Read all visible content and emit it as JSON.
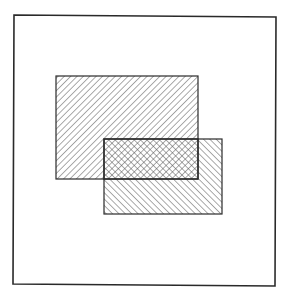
{
  "diagram": {
    "type": "venn-intersection",
    "background": "#ffffff",
    "stroke_color": "#2a2a2a",
    "hatch_color": "#555555",
    "universe": {
      "name": "universal-set",
      "corners": [
        [
          14,
          15
        ],
        [
          276,
          17
        ],
        [
          275,
          286
        ],
        [
          13,
          284
        ]
      ]
    },
    "sets": [
      {
        "name": "set-a",
        "x": 56,
        "y": 76,
        "width": 142,
        "height": 103,
        "hatch": "forward-diagonal"
      },
      {
        "name": "set-b",
        "x": 104,
        "y": 139,
        "width": 118,
        "height": 75,
        "hatch": "backward-diagonal"
      }
    ],
    "intersection": {
      "name": "a-intersect-b",
      "x": 104,
      "y": 139,
      "width": 94,
      "height": 40,
      "hatch": "crosshatch"
    },
    "hatch_spacing": 4.5
  }
}
